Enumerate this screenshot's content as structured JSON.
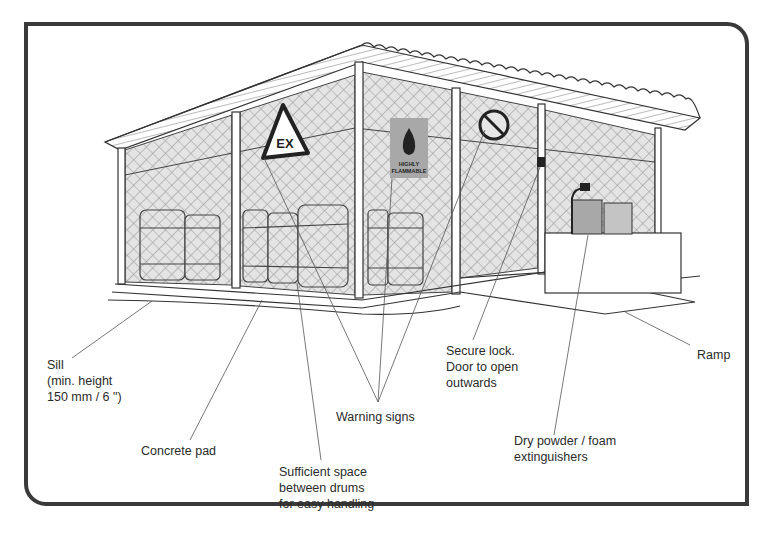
{
  "figure": {
    "signs": {
      "explosive": "EX",
      "flammable_line1": "HIGHLY",
      "flammable_line2": "FLAMMABLE"
    },
    "colors": {
      "frame": "#3a3a3a",
      "line": "#333333",
      "mesh": "#bdbdbd",
      "sign_grey": "#a8a8a8"
    }
  },
  "labels": {
    "sill": "Sill\n(min. height\n150 mm / 6 \")",
    "concrete_pad": "Concrete pad",
    "sufficient_space": "Sufficient space\nbetween drums\nfor easy handling",
    "warning_signs": "Warning signs",
    "secure_lock": "Secure lock.\nDoor to open\noutwards",
    "extinguishers": "Dry powder / foam\nextinguishers",
    "ramp": "Ramp"
  }
}
